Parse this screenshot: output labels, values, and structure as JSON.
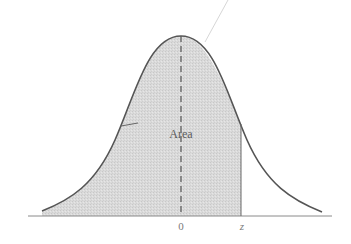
{
  "diagram": {
    "type": "normal-distribution-curve",
    "shaded_region_label": "Area",
    "axis": {
      "tick_labels": [
        {
          "label": "0",
          "position": "mean"
        },
        {
          "label": "z",
          "position": "cutoff"
        }
      ]
    },
    "colors": {
      "curve": "#555555",
      "shade": "#d9d9d9",
      "axis": "#8a8a8a",
      "mean_line": "#555555",
      "background": "#ffffff"
    }
  }
}
